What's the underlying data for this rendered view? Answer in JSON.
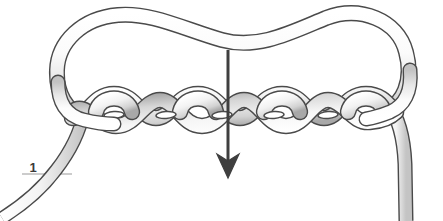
{
  "figure": {
    "type": "knot-tying-diagram",
    "background_color": "#ffffff",
    "width": 443,
    "height": 221
  },
  "labels": [
    {
      "id": "step-1",
      "text": "1",
      "x": 33,
      "y": 172,
      "leader_line": {
        "x1": 22,
        "y1": 174,
        "x2": 72,
        "y2": 174,
        "color": "#9a9a9a"
      }
    }
  ],
  "arrow": {
    "name": "direction-arrow",
    "label": "",
    "color": "#3f3f3f",
    "x": 228,
    "y_start": 50,
    "y_end": 178,
    "head_width": 22,
    "head_height": 24,
    "shaft_width": 3
  },
  "rope": {
    "outline_color": "#4a4a4a",
    "fill_light": "#ffffff",
    "fill_mid": "#ebebeb",
    "fill_shadow": "#b8b8b8",
    "stroke_width": 1.6,
    "strand_width": 13
  },
  "braid": {
    "name": "twisted-braid",
    "x_start": 75,
    "x_end": 388,
    "center_y": 110,
    "twist_count": 6,
    "amplitude": 17,
    "eyelet_count": 6
  },
  "loop": {
    "name": "upper-loop",
    "top_y": 14,
    "left_x": 58,
    "right_x": 412,
    "center_dip_y": 40
  },
  "tails": [
    {
      "name": "left-working-end",
      "from_x": 78,
      "from_y": 118,
      "to_x": 2,
      "to_y": 220
    },
    {
      "name": "right-standing-end",
      "from_x": 398,
      "from_y": 120,
      "to_x": 404,
      "to_y": 221
    }
  ],
  "colors": {
    "outline": "#4a4a4a",
    "arrow": "#3f3f3f",
    "label_text": "#3a3a3a",
    "leader": "#9a9a9a",
    "background": "#ffffff"
  }
}
